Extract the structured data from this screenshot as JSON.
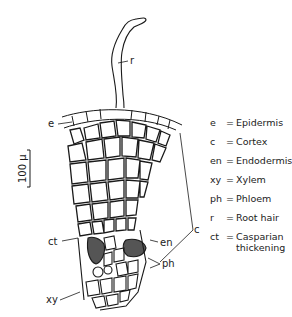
{
  "figure": {
    "scale_bar": {
      "label": "100 μ"
    },
    "labels": {
      "r": "r",
      "e": "e",
      "c": "c",
      "en": "en",
      "ct": "ct",
      "xy": "xy",
      "ph": "ph"
    },
    "legend": [
      {
        "abbr": "e",
        "eq": "=",
        "def": "Epidermis"
      },
      {
        "abbr": "c",
        "eq": "=",
        "def": "Cortex"
      },
      {
        "abbr": "en",
        "eq": "=",
        "def": "Endodermis"
      },
      {
        "abbr": "xy",
        "eq": "=",
        "def": "Xylem"
      },
      {
        "abbr": "ph",
        "eq": "=",
        "def": "Phloem"
      },
      {
        "abbr": "r",
        "eq": "=",
        "def": "Root  hair"
      },
      {
        "abbr": "ct",
        "eq": "=",
        "def": "Casparian\nthickening"
      }
    ],
    "colors": {
      "ink": "#1a1a1a",
      "background": "#ffffff",
      "tissue_dark": "#333333"
    }
  }
}
